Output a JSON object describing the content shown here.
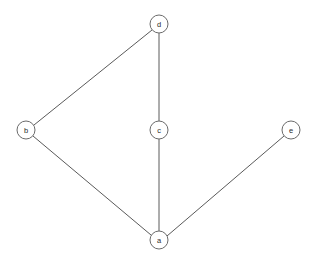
{
  "chart_data": {
    "type": "diagram",
    "title": "",
    "subtitle": "",
    "xlabel": "",
    "ylabel": "",
    "graph_kind": "undirected-node-link-graph",
    "background_color": "#ffffff",
    "node_stroke_color": "#6b6b6b",
    "node_fill_color": "#ffffff",
    "edge_color": "#5a5a5a",
    "label_color": "#2b2b2b",
    "node_radius": 9,
    "canvas": {
      "width": 314,
      "height": 264
    },
    "nodes": [
      {
        "id": "d",
        "label": "d",
        "x": 159,
        "y": 24
      },
      {
        "id": "b",
        "label": "b",
        "x": 26,
        "y": 130
      },
      {
        "id": "c",
        "label": "c",
        "x": 159,
        "y": 130
      },
      {
        "id": "e",
        "label": "e",
        "x": 291,
        "y": 130
      },
      {
        "id": "a",
        "label": "a",
        "x": 159,
        "y": 240
      }
    ],
    "edges": [
      {
        "source": "b",
        "target": "d",
        "x1": 34,
        "y1": 125,
        "x2": 152,
        "y2": 30
      },
      {
        "source": "d",
        "target": "c",
        "x1": 159,
        "y1": 33,
        "x2": 159,
        "y2": 121
      },
      {
        "source": "c",
        "target": "a",
        "x1": 159,
        "y1": 139,
        "x2": 159,
        "y2": 231
      },
      {
        "source": "b",
        "target": "a",
        "x1": 33,
        "y1": 136,
        "x2": 151,
        "y2": 235
      },
      {
        "source": "a",
        "target": "e",
        "x1": 167,
        "y1": 236,
        "x2": 284,
        "y2": 136
      }
    ],
    "node_count": 5,
    "edge_count": 5,
    "legend": [],
    "annotations": []
  }
}
